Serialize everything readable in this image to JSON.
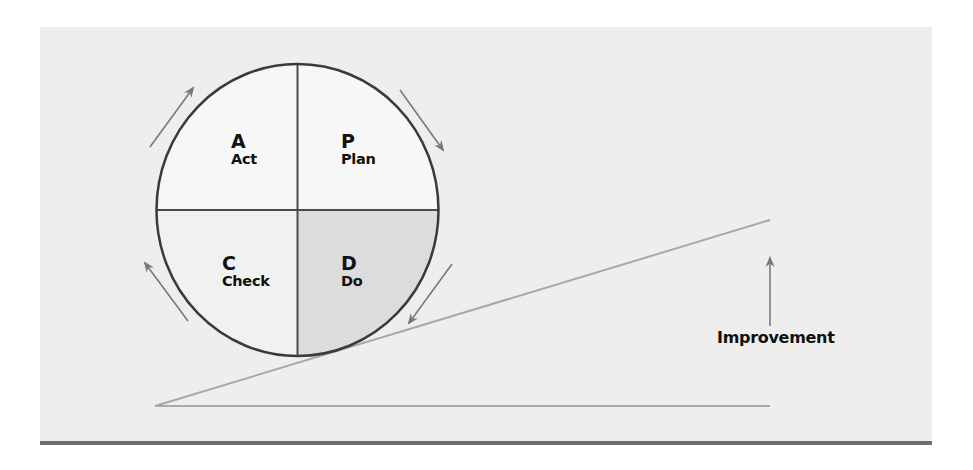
{
  "diagram": {
    "colors": {
      "background": "#eeeeee",
      "quadrant_light": "#f7f7f7",
      "quadrant_check": "#f1f1f1",
      "quadrant_do": "#dcdcdc",
      "circle_stroke": "#3a3a3a",
      "arrow": "#7a7a7a",
      "incline": "#a8a8a8",
      "bottom_rule": "#6e6e6e"
    },
    "quadrants": [
      {
        "position": "top-left",
        "letter": "A",
        "label": "Act"
      },
      {
        "position": "top-right",
        "letter": "P",
        "label": "Plan"
      },
      {
        "position": "bottom-left",
        "letter": "C",
        "label": "Check"
      },
      {
        "position": "bottom-right",
        "letter": "D",
        "label": "Do"
      }
    ],
    "cycle_direction": "clockwise",
    "improvement_label": "Improvement"
  }
}
